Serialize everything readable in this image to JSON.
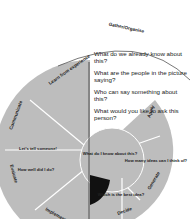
{
  "diagram": {
    "title": "Gather/Organise",
    "center": "What do I know about this?",
    "questions": [
      "What do we already know about this?",
      "What are the people in the picture saying?",
      "Who can say something about this?",
      "What would you like to ask this person?"
    ],
    "stages": [
      {
        "rim": "Learn from experience",
        "inner": "What ..."
      },
      {
        "rim": "Communicate",
        "inner": "Let's tell someone!"
      },
      {
        "rim": "Evaluate",
        "inner": "How well did I do?"
      },
      {
        "rim": "Implement",
        "inner": ""
      },
      {
        "rim": "Decide",
        "inner": "Which is the best idea?"
      },
      {
        "rim": "Generate",
        "inner": "How many ideas can I think of?"
      },
      {
        "rim": "Apply",
        "inner": ""
      }
    ],
    "colors": {
      "segment": "#bdbdbd",
      "divider": "#ffffff",
      "line": "#333333",
      "wedge": "#111111"
    }
  }
}
